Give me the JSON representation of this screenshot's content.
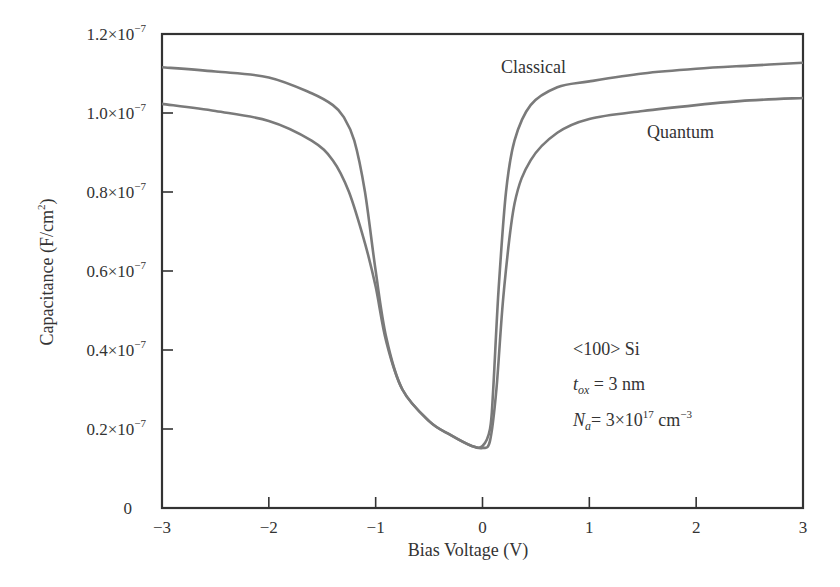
{
  "chart_data": {
    "type": "line",
    "title": "",
    "xlabel": "Bias Voltage (V)",
    "ylabel": "Capacitance (F/cm²)",
    "ylabel_parts": {
      "main": "Capacitance (F/cm",
      "sup": "2",
      "tail": ")"
    },
    "xlim": [
      -3,
      3
    ],
    "ylim": [
      0,
      1.2e-07
    ],
    "grid": false,
    "legend": "inline labels",
    "x_ticks": [
      -3,
      -2,
      -1,
      0,
      1,
      2,
      3
    ],
    "x_tick_labels": [
      "−3",
      "−2",
      "−1",
      "0",
      "1",
      "2",
      "3"
    ],
    "y_ticks": [
      0,
      2e-08,
      4e-08,
      6e-08,
      8e-08,
      1e-07,
      1.2e-07
    ],
    "y_tick_labels": [
      {
        "mant": "0",
        "exp": ""
      },
      {
        "mant": "0.2×10",
        "exp": "−7"
      },
      {
        "mant": "0.4×10",
        "exp": "−7"
      },
      {
        "mant": "0.6×10",
        "exp": "−7"
      },
      {
        "mant": "0.8×10",
        "exp": "−7"
      },
      {
        "mant": "1.0×10",
        "exp": "−7"
      },
      {
        "mant": "1.2×10",
        "exp": "−7"
      }
    ],
    "y_unit_scale": 1e-07,
    "series": [
      {
        "name": "Classical",
        "color": "#7a7a7a",
        "label_pos": {
          "x": 0.17,
          "y": 1.125
        },
        "x": [
          -3,
          -2.5,
          -2,
          -1.6,
          -1.4,
          -1.3,
          -1.2,
          -1.1,
          -1.0,
          -0.9,
          -0.75,
          -0.5,
          -0.3,
          -0.1,
          0.0,
          0.07,
          0.1,
          0.15,
          0.22,
          0.3,
          0.45,
          0.7,
          1.0,
          1.5,
          2.0,
          2.5,
          3.0
        ],
        "y": [
          1.116,
          1.105,
          1.09,
          1.05,
          1.02,
          0.99,
          0.93,
          0.8,
          0.6,
          0.43,
          0.3,
          0.22,
          0.185,
          0.157,
          0.157,
          0.2,
          0.3,
          0.55,
          0.8,
          0.93,
          1.02,
          1.065,
          1.08,
          1.1,
          1.112,
          1.12,
          1.127
        ]
      },
      {
        "name": "Quantum",
        "color": "#7a7a7a",
        "label_pos": {
          "x": 1.3,
          "y": 0.925
        },
        "x": [
          -3,
          -2.5,
          -2,
          -1.6,
          -1.4,
          -1.25,
          -1.1,
          -1.0,
          -0.9,
          -0.75,
          -0.5,
          -0.3,
          -0.1,
          0.0,
          0.07,
          0.13,
          0.2,
          0.3,
          0.45,
          0.7,
          1.0,
          1.5,
          2.0,
          2.5,
          3.0
        ],
        "y": [
          1.023,
          1.005,
          0.98,
          0.93,
          0.88,
          0.8,
          0.67,
          0.56,
          0.42,
          0.3,
          0.22,
          0.185,
          0.157,
          0.152,
          0.17,
          0.3,
          0.55,
          0.77,
          0.88,
          0.95,
          0.985,
          1.005,
          1.02,
          1.032,
          1.038
        ]
      }
    ],
    "annotations": [
      {
        "text": "<100> Si"
      },
      {
        "var": "t",
        "sub": "ox",
        "rest": " = 3 nm"
      },
      {
        "var": "N",
        "sub": "a",
        "rest": "= 3×10",
        "sup": "17",
        "rest2": " cm",
        "sup2": "−3"
      }
    ]
  },
  "labels": {
    "classical": "Classical",
    "quantum": "Quantum",
    "xlabel": "Bias Voltage (V)",
    "note_material": "<100> Si",
    "note_tox_var": "t",
    "note_tox_sub": "ox",
    "note_tox_rest": " = 3 nm",
    "note_na_var": "N",
    "note_na_sub": "a",
    "note_na_rest": "= 3×10",
    "note_na_sup": "17",
    "note_na_rest2": " cm",
    "note_na_sup2": "−3",
    "ylabel_main": "Capacitance (F/cm",
    "ylabel_sup": "2",
    "ylabel_tail": ")"
  }
}
